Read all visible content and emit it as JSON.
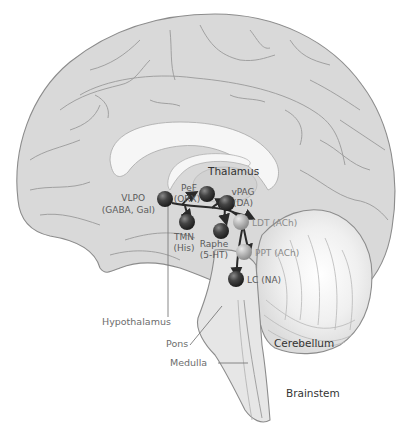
{
  "diagram": {
    "type": "brain-sagittal-section",
    "colors": {
      "brain_fill": "#d9d9d9",
      "white_matter": "#f4f4f4",
      "outline": "#8c8c8c",
      "dark_nucleus": "#3a3a3a",
      "light_nucleus": "#b0b0b0",
      "arrow": "#2a2a2a",
      "label_gray": "#6d6d6d",
      "label_dark": "#333333"
    },
    "structure_labels": {
      "thalamus": "Thalamus",
      "hypothalamus": "Hypothalamus",
      "pons": "Pons",
      "medulla": "Medulla",
      "cerebellum": "Cerebellum",
      "brainstem": "Brainstem"
    },
    "nuclei": [
      {
        "id": "vlpo",
        "name": "VLPO",
        "transmitter": "(GABA, Gal)",
        "shade": "dark"
      },
      {
        "id": "pef",
        "name": "PeF",
        "transmitter": "(ORX)",
        "shade": "dark"
      },
      {
        "id": "vpag",
        "name": "vPAG",
        "transmitter": "(DA)",
        "shade": "dark"
      },
      {
        "id": "tmn",
        "name": "TMN",
        "transmitter": "(His)",
        "shade": "dark"
      },
      {
        "id": "raphe",
        "name": "Raphe",
        "transmitter": "(5-HT)",
        "shade": "dark"
      },
      {
        "id": "ldt",
        "name": "LDT",
        "transmitter": "(ACh)",
        "shade": "light"
      },
      {
        "id": "ppt",
        "name": "PPT",
        "transmitter": "(ACh)",
        "shade": "light"
      },
      {
        "id": "lc",
        "name": "LC",
        "transmitter": "(NA)",
        "shade": "dark"
      }
    ],
    "nucleus_labels": {
      "vlpo_line1": "VLPO",
      "vlpo_line2": "(GABA, Gal)",
      "pef_line1": "PeF",
      "pef_line2": "(ORX)",
      "vpag_line1": "vPAG",
      "vpag_line2": "(DA)",
      "tmn_line1": "TMN",
      "tmn_line2": "(His)",
      "raphe_line1": "Raphe",
      "raphe_line2": "(5-HT)",
      "ldt": "LDT (ACh)",
      "ppt": "PPT (ACh)",
      "lc": "LC (NA)"
    },
    "projections_from": "VLPO",
    "projections_to": [
      "PeF",
      "TMN",
      "vPAG",
      "Raphe",
      "LDT",
      "PPT",
      "LC"
    ]
  }
}
